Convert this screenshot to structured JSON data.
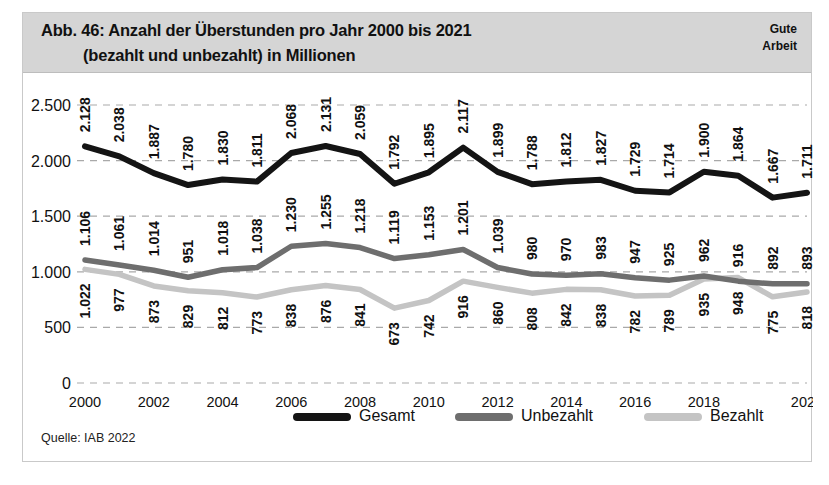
{
  "header": {
    "title_line1": "Abb. 46: Anzahl der Überstunden pro Jahr 2000 bis 2021",
    "title_line2": "(bezahlt und unbezahlt) in Millionen",
    "brand_line1": "Gute",
    "brand_line2": "Arbeit"
  },
  "source": "Quelle: IAB 2022",
  "colors": {
    "gesamt": "#141414",
    "unbezahlt": "#6e6e6e",
    "bezahlt": "#c4c4c4",
    "band": "#d5d5d5",
    "grid": "#a9a9a9",
    "text": "#111111"
  },
  "chart_data": {
    "type": "line",
    "title": "Abb. 46: Anzahl der Überstunden pro Jahr 2000 bis 2021 (bezahlt und unbezahlt) in Millionen",
    "xlabel": "",
    "ylabel": "",
    "ylim": [
      0,
      2500
    ],
    "yticks": [
      0,
      500,
      1000,
      1500,
      2000,
      2500
    ],
    "ytick_labels": [
      "0",
      "500",
      "1.000",
      "1.500",
      "2.000",
      "2.500"
    ],
    "grid": true,
    "legend_position": "bottom",
    "x": [
      2000,
      2001,
      2002,
      2003,
      2004,
      2005,
      2006,
      2007,
      2008,
      2009,
      2010,
      2011,
      2012,
      2013,
      2014,
      2015,
      2016,
      2017,
      2018,
      2019,
      2020,
      2021
    ],
    "xtick_labels": [
      "2000",
      "2002",
      "2004",
      "2006",
      "2008",
      "2010",
      "2012",
      "2014",
      "2016",
      "2018",
      "2021"
    ],
    "xticks": [
      2000,
      2002,
      2004,
      2006,
      2008,
      2010,
      2012,
      2014,
      2016,
      2018,
      2021
    ],
    "series": [
      {
        "name": "Gesamt",
        "color": "#141414",
        "values": [
          2128,
          2038,
          1887,
          1780,
          1830,
          1811,
          2068,
          2131,
          2059,
          1792,
          1895,
          2117,
          1899,
          1788,
          1812,
          1827,
          1729,
          1714,
          1900,
          1864,
          1667,
          1711
        ],
        "labels": [
          "2.128",
          "2.038",
          "1.887",
          "1.780",
          "1.830",
          "1.811",
          "2.068",
          "2.131",
          "2.059",
          "1.792",
          "1.895",
          "2.117",
          "1.899",
          "1.788",
          "1.812",
          "1.827",
          "1.729",
          "1.714",
          "1.900",
          "1.864",
          "1.667",
          "1.711"
        ]
      },
      {
        "name": "Unbezahlt",
        "color": "#6e6e6e",
        "values": [
          1106,
          1061,
          1014,
          951,
          1018,
          1038,
          1230,
          1255,
          1218,
          1119,
          1153,
          1201,
          1039,
          980,
          970,
          983,
          947,
          925,
          962,
          916,
          892,
          893
        ],
        "labels": [
          "1.106",
          "1.061",
          "1.014",
          "951",
          "1.018",
          "1.038",
          "1.230",
          "1.255",
          "1.218",
          "1.119",
          "1.153",
          "1.201",
          "1.039",
          "980",
          "970",
          "983",
          "947",
          "925",
          "962",
          "916",
          "892",
          "893"
        ]
      },
      {
        "name": "Bezahlt",
        "color": "#c4c4c4",
        "values": [
          1022,
          977,
          873,
          829,
          812,
          773,
          838,
          876,
          841,
          673,
          742,
          916,
          860,
          808,
          842,
          838,
          782,
          789,
          935,
          948,
          775,
          818
        ],
        "labels": [
          "1.022",
          "977",
          "873",
          "829",
          "812",
          "773",
          "838",
          "876",
          "841",
          "673",
          "742",
          "916",
          "860",
          "808",
          "842",
          "838",
          "782",
          "789",
          "935",
          "948",
          "775",
          "818"
        ]
      }
    ]
  }
}
